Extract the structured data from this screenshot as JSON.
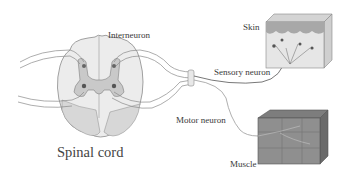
{
  "diagram": {
    "labels": {
      "interneuron": "Interneuron",
      "skin": "Skin",
      "sensory_neuron": "Sensory neuron",
      "motor_neuron": "Motor neuron",
      "muscle": "Muscle",
      "spinal_cord": "Spinal cord"
    },
    "colors": {
      "white_matter": "#ececec",
      "grey_matter": "#c9c9c9",
      "outline": "#8a8a8a",
      "nerve_fill": "#f2f2f2",
      "skin_epidermis": "#a8a8a8",
      "skin_dermis": "#e4e4e4",
      "muscle_fill": "#8f8f8f",
      "text": "#3a3a3a"
    }
  }
}
